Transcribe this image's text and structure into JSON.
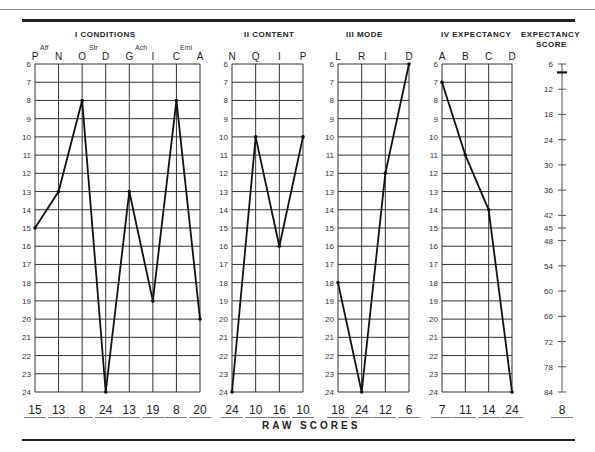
{
  "titles": {
    "conditions": "I CONDITIONS",
    "content": "II CONTENT",
    "mode": "III MODE",
    "expectancy": "IV EXPECTANCY",
    "expectancy_score_line1": "EXPECTANCY",
    "expectancy_score_line2": "SCORE",
    "raw_scores": "RAW SCORES"
  },
  "subgroups": {
    "aff": "Aff",
    "str": "Str",
    "ach": "Ach",
    "emi": "Emi"
  },
  "chart_data": {
    "type": "line",
    "ylabel": "",
    "ylim": [
      6,
      24
    ],
    "y_ticks": [
      6,
      7,
      8,
      9,
      10,
      11,
      12,
      13,
      14,
      15,
      16,
      17,
      18,
      19,
      20,
      21,
      22,
      23,
      24
    ],
    "y_inverted": true,
    "grid": true,
    "panels": [
      {
        "name": "I CONDITIONS",
        "categories": [
          "P",
          "N",
          "O",
          "D",
          "G",
          "I",
          "C",
          "A"
        ],
        "values": [
          15,
          13,
          8,
          24,
          13,
          19,
          8,
          20
        ],
        "groups": [
          "Aff",
          "Str",
          "Ach",
          "Emi"
        ]
      },
      {
        "name": "II CONTENT",
        "categories": [
          "N",
          "Q",
          "I",
          "P"
        ],
        "values": [
          24,
          10,
          16,
          10
        ]
      },
      {
        "name": "III MODE",
        "categories": [
          "L",
          "R",
          "I",
          "D"
        ],
        "values": [
          18,
          24,
          12,
          6
        ]
      },
      {
        "name": "IV EXPECTANCY",
        "categories": [
          "A",
          "B",
          "C",
          "D"
        ],
        "values": [
          7,
          11,
          14,
          24
        ]
      }
    ],
    "expectancy_score": {
      "label": "EXPECTANCY SCORE",
      "ticks": [
        6,
        12,
        18,
        24,
        30,
        36,
        42,
        45,
        48,
        54,
        60,
        66,
        72,
        78,
        84
      ],
      "value": 8
    },
    "raw_scores_label": "RAW SCORES"
  },
  "raw_scores": {
    "conditions": [
      "15",
      "13",
      "8",
      "24",
      "13",
      "19",
      "8",
      "20"
    ],
    "content": [
      "24",
      "10",
      "16",
      "10"
    ],
    "mode": [
      "18",
      "24",
      "12",
      "6"
    ],
    "expectancy": [
      "7",
      "11",
      "14",
      "24"
    ],
    "expectancy_score": "8"
  }
}
